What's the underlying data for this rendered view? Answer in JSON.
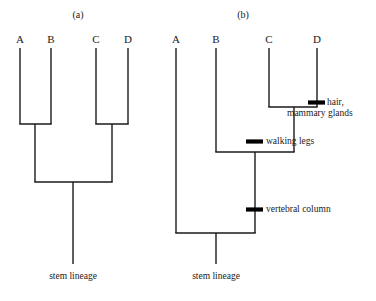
{
  "figure": {
    "background_color": "#ffffff",
    "line_color": "#1a1a1a",
    "tick_color": "#000000"
  },
  "panels": [
    {
      "id": "a",
      "caption": "(a)",
      "taxa": [
        {
          "label": "A"
        },
        {
          "label": "B"
        },
        {
          "label": "C"
        },
        {
          "label": "D"
        }
      ],
      "stem_label": "stem lineage",
      "traits": []
    },
    {
      "id": "b",
      "caption": "(b)",
      "taxa": [
        {
          "label": "A"
        },
        {
          "label": "B"
        },
        {
          "label": "C"
        },
        {
          "label": "D"
        }
      ],
      "stem_label": "stem lineage",
      "traits": [
        {
          "name": "hair-mammary-glands",
          "label": "hair,\nmammary glands",
          "line1": "hair,",
          "line2": "mammary glands"
        },
        {
          "name": "walking-legs",
          "label": "walking legs"
        },
        {
          "name": "vertebral-column",
          "label": "vertebral column"
        }
      ]
    }
  ]
}
